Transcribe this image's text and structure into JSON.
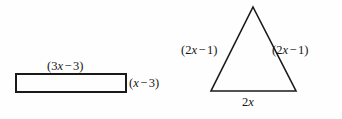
{
  "figure": {
    "background_color": "#fefefe",
    "stroke_color": "#1a1a1a",
    "text_color": "#161616"
  },
  "shapes": [
    {
      "name": "rectangle",
      "type": "rectangle",
      "stroke_width": 2,
      "fill": "none",
      "x": 16,
      "y": 74,
      "width": 110,
      "height": 18,
      "labels": {
        "top": "(3x − 3)",
        "right": "(x − 3)"
      }
    },
    {
      "name": "triangle",
      "type": "triangle",
      "stroke_width": 1.6,
      "fill": "none",
      "apex": [
        253,
        7
      ],
      "base_left": [
        211,
        91
      ],
      "base_right": [
        296,
        91
      ],
      "labels": {
        "left_side": "(2x − 1)",
        "right_side": "(2x − 1)",
        "base": "2x"
      }
    }
  ],
  "labels": {
    "rectangle_top": {
      "parts": [
        {
          "t": "(",
          "k": "paren"
        },
        {
          "t": "3",
          "k": "num"
        },
        {
          "t": "x",
          "k": "var"
        },
        {
          "t": "−",
          "k": "op"
        },
        {
          "t": "3",
          "k": "num"
        },
        {
          "t": ")",
          "k": "paren"
        }
      ],
      "plain": "(3x − 3)"
    },
    "rectangle_right": {
      "parts": [
        {
          "t": "(",
          "k": "paren"
        },
        {
          "t": "x",
          "k": "var"
        },
        {
          "t": "−",
          "k": "op"
        },
        {
          "t": "3",
          "k": "num"
        },
        {
          "t": ")",
          "k": "paren"
        }
      ],
      "plain": "(x − 3)"
    },
    "triangle_left": {
      "parts": [
        {
          "t": "(",
          "k": "paren"
        },
        {
          "t": "2",
          "k": "num"
        },
        {
          "t": "x",
          "k": "var"
        },
        {
          "t": "−",
          "k": "op"
        },
        {
          "t": "1",
          "k": "num"
        },
        {
          "t": ")",
          "k": "paren"
        }
      ],
      "plain": "(2x − 1)"
    },
    "triangle_right": {
      "parts": [
        {
          "t": "(",
          "k": "paren"
        },
        {
          "t": "2",
          "k": "num"
        },
        {
          "t": "x",
          "k": "var"
        },
        {
          "t": "−",
          "k": "op"
        },
        {
          "t": "1",
          "k": "num"
        },
        {
          "t": ")",
          "k": "paren"
        }
      ],
      "plain": "(2x − 1)"
    },
    "triangle_base": {
      "parts": [
        {
          "t": "2",
          "k": "num"
        },
        {
          "t": "x",
          "k": "var"
        }
      ],
      "plain": "2x"
    }
  }
}
